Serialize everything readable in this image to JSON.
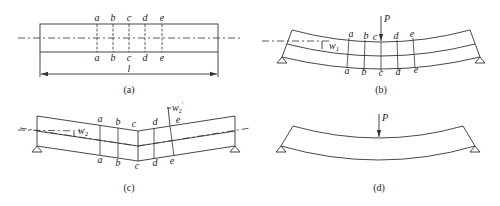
{
  "panels": {
    "a": {
      "caption": "(a)",
      "description": "Straight undeformed beam with sections",
      "section_labels_top": [
        "a",
        "b",
        "c",
        "d",
        "e"
      ],
      "section_labels_bottom": [
        "a",
        "b",
        "c",
        "d",
        "e"
      ],
      "length_label": "l"
    },
    "b": {
      "caption": "(b)",
      "description": "Simply supported beam bent by central load",
      "load_label": "P",
      "deflection_label": "w",
      "deflection_subscript": "1",
      "section_labels_top": [
        "a",
        "b",
        "c",
        "d",
        "e"
      ],
      "section_labels_bottom": [
        "a",
        "b",
        "c",
        "d",
        "e"
      ]
    },
    "c": {
      "caption": "(c)",
      "description": "Beam with kink at section c",
      "deflection_label": "w",
      "deflection_subscript": "2",
      "deflection_prime_label": "w",
      "deflection_prime_subscript": "2",
      "deflection_prime_mark": "′",
      "section_labels_top": [
        "a",
        "b",
        "c",
        "d",
        "e"
      ],
      "section_labels_bottom": [
        "a",
        "b",
        "c",
        "d",
        "e"
      ]
    },
    "d": {
      "caption": "(d)",
      "description": "Simply supported beam under load P",
      "load_label": "P"
    }
  },
  "colors": {
    "line": "#333333",
    "text": "#222222",
    "background": "#ffffff"
  }
}
